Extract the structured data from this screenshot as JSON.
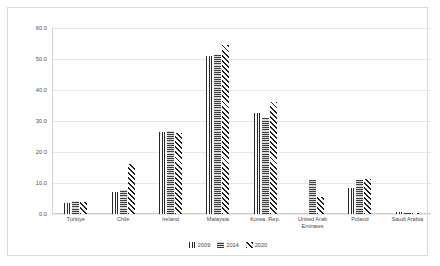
{
  "chart_data": {
    "type": "bar",
    "title": "",
    "xlabel": "",
    "ylabel": "",
    "ylim": [
      0.0,
      60.0
    ],
    "ytick_labels": [
      "60.0",
      "50.0",
      "40.0",
      "30.0",
      "20.0",
      "10.0",
      "0.0"
    ],
    "ytick_values": [
      60.0,
      50.0,
      40.0,
      30.0,
      20.0,
      10.0,
      0.0
    ],
    "grid": true,
    "legend_position": "bottom-center",
    "categories": [
      "Türkiye",
      "Chile",
      "Ireland",
      "Malaysia",
      "Korea, Rep.",
      "United Arab Emirates",
      "Poland",
      "Saudi Arabia"
    ],
    "series": [
      {
        "name": "2009",
        "values": [
          3.6,
          7.2,
          26.5,
          51.0,
          32.5,
          0.0,
          8.5,
          0.5
        ]
      },
      {
        "name": "2014",
        "values": [
          4.2,
          7.8,
          26.8,
          51.2,
          31.0,
          11.0,
          11.0,
          0.3
        ]
      },
      {
        "name": "2020",
        "values": [
          4.0,
          16.2,
          26.0,
          54.5,
          36.0,
          5.5,
          11.2,
          0.4
        ]
      }
    ]
  },
  "legend": {
    "items": [
      {
        "label": "2009"
      },
      {
        "label": "2014"
      },
      {
        "label": "2020"
      }
    ]
  }
}
